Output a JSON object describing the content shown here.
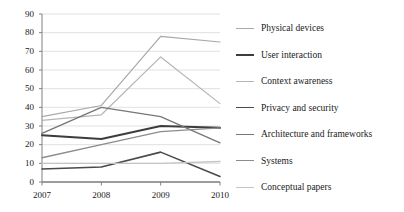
{
  "chart_data": {
    "type": "line",
    "title": "",
    "xlabel": "",
    "ylabel": "",
    "x": [
      "2007",
      "2008",
      "2009",
      "2010"
    ],
    "categories": [
      "2007",
      "2008",
      "2009",
      "2010"
    ],
    "ylim": [
      0,
      90
    ],
    "yticks": [
      0,
      10,
      20,
      30,
      40,
      50,
      60,
      70,
      80,
      90
    ],
    "grid": true,
    "legend_position": "right",
    "series": [
      {
        "name": "Physical devices",
        "values": [
          35,
          41,
          78,
          75
        ],
        "color": "#a8a8a8",
        "width": 1.2
      },
      {
        "name": "User interaction",
        "values": [
          25,
          23,
          30,
          29
        ],
        "color": "#3d3d3d",
        "width": 2.0
      },
      {
        "name": "Context awareness",
        "values": [
          33,
          36,
          67,
          42
        ],
        "color": "#b5b5b5",
        "width": 1.2
      },
      {
        "name": "Privacy and security",
        "values": [
          7,
          8,
          16,
          3
        ],
        "color": "#4a4a4a",
        "width": 1.6
      },
      {
        "name": "Architecture and frameworks",
        "values": [
          26,
          40,
          35,
          21
        ],
        "color": "#777777",
        "width": 1.4
      },
      {
        "name": "Systems",
        "values": [
          13,
          20,
          27,
          29
        ],
        "color": "#8c8c8c",
        "width": 1.4
      },
      {
        "name": "Conceptual papers",
        "values": [
          10,
          10,
          10,
          11
        ],
        "color": "#c4c4c4",
        "width": 1.4
      }
    ]
  },
  "axes": {
    "y_tick_labels": [
      "90",
      "80",
      "70",
      "60",
      "50",
      "40",
      "30",
      "20",
      "10",
      "0"
    ],
    "x_tick_labels": [
      "2007",
      "2008",
      "2009",
      "2010"
    ]
  },
  "legend": {
    "items": [
      {
        "label": "Physical devices"
      },
      {
        "label": "User interaction"
      },
      {
        "label": "Context awareness"
      },
      {
        "label": "Privacy and security"
      },
      {
        "label": "Architecture and frameworks"
      },
      {
        "label": "Systems"
      },
      {
        "label": "Conceptual papers"
      }
    ]
  },
  "colors": {
    "axis": "#808080",
    "grid": "#d9d9d9",
    "text": "#1a1a1a"
  }
}
